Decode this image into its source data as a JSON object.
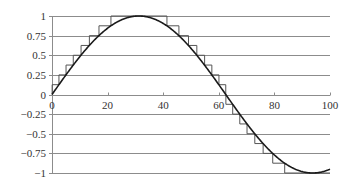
{
  "chart_data": {
    "type": "line",
    "title": "",
    "xlabel": "",
    "ylabel": "",
    "xlim": [
      0,
      100
    ],
    "ylim": [
      -1,
      1
    ],
    "x_ticks": [
      0,
      20,
      40,
      60,
      80,
      100
    ],
    "x_tick_labels": [
      "0",
      "20",
      "40",
      "60",
      "80",
      "100"
    ],
    "y_ticks": [
      1,
      0.75,
      0.5,
      0.25,
      0,
      -0.25,
      -0.5,
      -0.75,
      -1
    ],
    "y_tick_labels": [
      "1",
      "0.75",
      "0.5",
      "0.25",
      "0",
      "−0.25",
      "−0.5",
      "−0.75",
      "−1"
    ],
    "grid": {
      "horizontal": true,
      "vertical": false
    },
    "legend": null,
    "series": [
      {
        "name": "sine curve",
        "style": "smooth",
        "function": "sin(2*pi*x/125)",
        "x": [
          0,
          5,
          10,
          15,
          20,
          25,
          30,
          35,
          40,
          45,
          50,
          55,
          60,
          65,
          70,
          75,
          80,
          85,
          90,
          95,
          100
        ],
        "values": [
          0,
          0.249,
          0.482,
          0.685,
          0.844,
          0.951,
          0.998,
          0.982,
          0.905,
          0.771,
          0.588,
          0.368,
          0.125,
          -0.125,
          -0.368,
          -0.588,
          -0.771,
          -0.905,
          -0.982,
          -0.998,
          -0.951
        ]
      },
      {
        "name": "quantized staircase",
        "style": "step",
        "quantization_step": 0.125,
        "rounding": "away-from-zero",
        "x": [
          0,
          5,
          10,
          15,
          20,
          25,
          30,
          35,
          40,
          45,
          50,
          55,
          60,
          65,
          70,
          75,
          80,
          85,
          90,
          95,
          100
        ],
        "values": [
          0,
          0.25,
          0.5,
          0.75,
          0.875,
          1,
          1,
          1,
          1,
          0.875,
          0.625,
          0.375,
          0.125,
          -0.125,
          -0.375,
          -0.625,
          -0.875,
          -1,
          -1,
          -1,
          -1
        ]
      }
    ]
  },
  "axes": {
    "x_labels": [
      "0",
      "20",
      "40",
      "60",
      "80",
      "100"
    ],
    "y_labels": [
      "1",
      "0.75",
      "0.5",
      "0.25",
      "0",
      "−0.25",
      "−0.5",
      "−0.75",
      "−1"
    ]
  },
  "colors": {
    "curve": "#1a1a1a",
    "staircase": "#555555",
    "grid": "#8c8c8c",
    "axis": "#8c8c8c",
    "labels": "#333333"
  }
}
